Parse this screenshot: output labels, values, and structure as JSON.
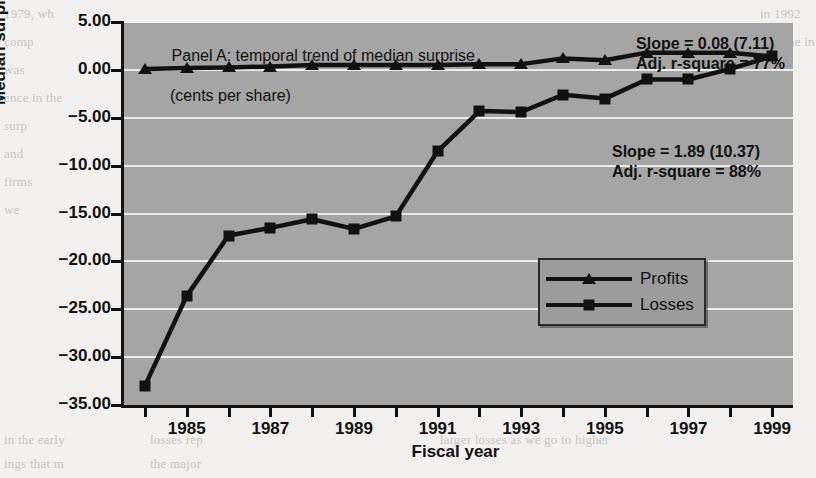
{
  "figure": {
    "panel_title_line1": "Panel A: temporal trend of median surprise",
    "panel_title_line2": "(cents per share)",
    "x_axis_title": "Fiscal year",
    "y_axis_title": "Median surprise (cents/share)"
  },
  "annotations": {
    "profits": {
      "slope": "Slope = 0.08 (7.11)",
      "rsquare": "Adj. r-square = 77%"
    },
    "losses": {
      "slope": "Slope = 1.89 (10.37)",
      "rsquare": "Adj. r-square = 88%"
    }
  },
  "legend": {
    "position": "inside-right-middle",
    "entries": [
      {
        "label": "Profits",
        "marker": "triangle-marker"
      },
      {
        "label": "Losses",
        "marker": "square-marker"
      }
    ]
  },
  "colors": {
    "plot_background": "#a5a5a5",
    "page_background": "#f2f1ef",
    "series_line": "#111111",
    "gridline": "#f3f3f3",
    "legend_background": "#9c9c9c"
  },
  "chart_data": {
    "type": "line",
    "title": "Panel A: temporal trend of median surprise (cents per share)",
    "xlabel": "Fiscal year",
    "ylabel": "Median surprise (cents/share)",
    "xlim": [
      1983.5,
      1999.5
    ],
    "ylim": [
      -35.0,
      5.0
    ],
    "grid": true,
    "legend_position": "inside-right-middle",
    "x": [
      1984,
      1985,
      1986,
      1987,
      1988,
      1989,
      1990,
      1991,
      1992,
      1993,
      1994,
      1995,
      1996,
      1997,
      1998,
      1999
    ],
    "x_tick_labels": [
      "1985",
      "1987",
      "1989",
      "1991",
      "1993",
      "1995",
      "1997",
      "1999"
    ],
    "x_tick_values": [
      1985,
      1987,
      1989,
      1991,
      1993,
      1995,
      1997,
      1999
    ],
    "y_tick_labels": [
      "5.00",
      "0.00",
      "-5.00",
      "-10.00",
      "-15.00",
      "-20.00",
      "-25.00",
      "-30.00",
      "-35.00"
    ],
    "y_tick_values": [
      5,
      0,
      -5,
      -10,
      -15,
      -20,
      -25,
      -30,
      -35
    ],
    "series": [
      {
        "name": "Profits",
        "marker": "triangle",
        "values": [
          0.1,
          0.2,
          0.25,
          0.35,
          0.5,
          0.5,
          0.5,
          0.5,
          0.6,
          0.6,
          1.2,
          1.0,
          1.8,
          1.8,
          1.8,
          1.4
        ]
      },
      {
        "name": "Losses",
        "marker": "square",
        "values": [
          -33.0,
          -23.6,
          -17.3,
          -16.5,
          -15.6,
          -16.6,
          -15.3,
          -8.5,
          -4.3,
          -4.4,
          -2.6,
          -3.0,
          -1.0,
          -1.0,
          0.1,
          1.4
        ]
      }
    ],
    "annotations": [
      {
        "text": "Slope = 0.08 (7.11)",
        "series": "Profits"
      },
      {
        "text": "Adj. r-square = 77%",
        "series": "Profits"
      },
      {
        "text": "Slope = 1.89 (10.37)",
        "series": "Losses"
      },
      {
        "text": "Adj. r-square = 88%",
        "series": "Losses"
      }
    ]
  },
  "scan_background": {
    "fragments": [
      "1979, wh",
      "comp",
      "was",
      "ence in the",
      "surp",
      "and",
      "firms",
      "we",
      "in 1992",
      "was the in",
      "in the early",
      "ings that m",
      "losses rep",
      "the major",
      "larger losses as we go to higher"
    ]
  }
}
